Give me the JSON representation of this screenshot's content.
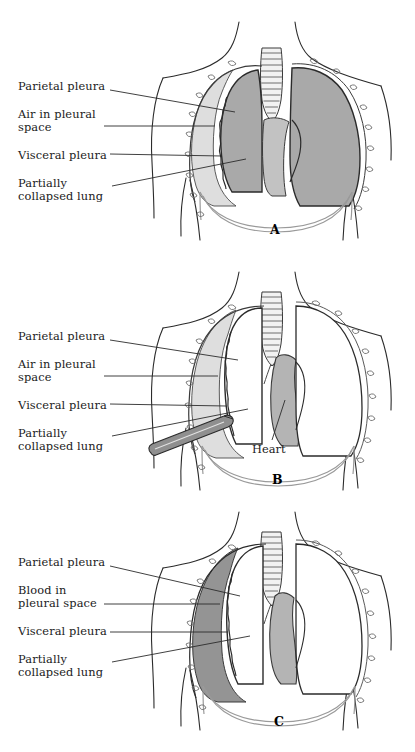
{
  "figure": {
    "type": "medical-illustration",
    "panels": [
      {
        "id": "A",
        "letter": "A",
        "condition": "Pneumothorax",
        "labels": [
          {
            "name": "parietal-pleura",
            "text": "Parietal pleura",
            "x": 18,
            "y": 86
          },
          {
            "name": "air-in-pleural-space",
            "text": "Air in pleural\nspace",
            "x": 18,
            "y": 114
          },
          {
            "name": "visceral-pleura",
            "text": "Visceral pleura",
            "x": 18,
            "y": 150
          },
          {
            "name": "partially-collapsed-lung",
            "text": "Partially\ncollapsed lung",
            "x": 18,
            "y": 178
          }
        ]
      },
      {
        "id": "B",
        "letter": "B",
        "condition": "Needle decompression of pneumothorax",
        "labels": [
          {
            "name": "parietal-pleura",
            "text": "Parietal pleura",
            "x": 18,
            "y": 86
          },
          {
            "name": "air-in-pleural-space",
            "text": "Air in pleural\nspace",
            "x": 18,
            "y": 114
          },
          {
            "name": "visceral-pleura",
            "text": "Visceral pleura",
            "x": 18,
            "y": 150
          },
          {
            "name": "partially-collapsed-lung",
            "text": "Partially\ncollapsed lung",
            "x": 18,
            "y": 178
          },
          {
            "name": "heart",
            "text": "Heart",
            "x": 253,
            "y": 195
          }
        ]
      },
      {
        "id": "C",
        "letter": "C",
        "condition": "Hemothorax",
        "labels": [
          {
            "name": "parietal-pleura",
            "text": "Parietal pleura",
            "x": 18,
            "y": 62
          },
          {
            "name": "blood-in-pleural-space",
            "text": "Blood in\npleural space",
            "x": 18,
            "y": 90
          },
          {
            "name": "visceral-pleura",
            "text": "Visceral pleura",
            "x": 18,
            "y": 126
          },
          {
            "name": "partially-collapsed-lung",
            "text": "Partially\ncollapsed lung",
            "x": 18,
            "y": 154
          }
        ]
      }
    ],
    "colors": {
      "outline": "#2b2b2b",
      "lung_fill_shaded": "#a9a9a9",
      "pleural_air_fill": "#dedede",
      "pleural_blood_fill": "#949494",
      "heart_fill": "#c2c2c2",
      "needle_fill": "#8f8f8f",
      "lung_fill_white": "#ffffff",
      "background": "#ffffff",
      "leader_line": "#2b2b2b"
    }
  }
}
